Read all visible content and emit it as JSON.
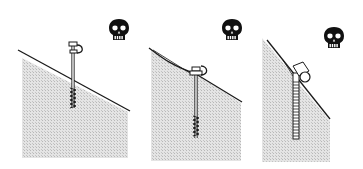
{
  "diagram": {
    "colors": {
      "background": "#ffffff",
      "ice_fill": "#d9d9d9",
      "line": "#1a1a1a",
      "skull": "#111111"
    },
    "panels": [
      {
        "id": "panel-1",
        "label": "",
        "warning": "skull-icon"
      },
      {
        "id": "panel-2",
        "label": "",
        "warning": "skull-icon"
      },
      {
        "id": "panel-3",
        "label": "",
        "warning": "skull-icon"
      }
    ]
  }
}
